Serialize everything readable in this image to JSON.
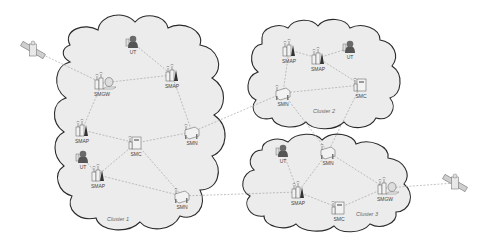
{
  "diagram": {
    "type": "network-topology",
    "clusters": [
      {
        "id": "c1",
        "label": "Cluster 1",
        "label_pos": [
          118,
          221
        ]
      },
      {
        "id": "c2",
        "label": "Cluster 2",
        "label_pos": [
          324,
          113
        ]
      },
      {
        "id": "c3",
        "label": "Cluster 3",
        "label_pos": [
          367,
          216
        ]
      }
    ],
    "nodes": [
      {
        "id": "sat1",
        "type": "satellite",
        "label": "",
        "x": 33,
        "y": 50,
        "cluster": "none"
      },
      {
        "id": "c1_ut1",
        "type": "UT",
        "label": "UT",
        "x": 133,
        "y": 43,
        "cluster": "c1"
      },
      {
        "id": "c1_smgw",
        "type": "SMGW",
        "label": "SMGW",
        "x": 102,
        "y": 83,
        "cluster": "c1"
      },
      {
        "id": "c1_smap1",
        "type": "SMAP",
        "label": "SMAP",
        "x": 172,
        "y": 75,
        "cluster": "c1"
      },
      {
        "id": "c1_smap2",
        "type": "SMAP",
        "label": "SMAP",
        "x": 82,
        "y": 130,
        "cluster": "c1"
      },
      {
        "id": "c1_smc",
        "type": "SMC",
        "label": "SMC",
        "x": 136,
        "y": 143,
        "cluster": "c1"
      },
      {
        "id": "c1_smn1",
        "type": "SMN",
        "label": "SMN",
        "x": 192,
        "y": 132,
        "cluster": "c1"
      },
      {
        "id": "c1_ut2",
        "type": "UT",
        "label": "UT",
        "x": 83,
        "y": 158,
        "cluster": "c1"
      },
      {
        "id": "c1_smap3",
        "type": "SMAP",
        "label": "SMAP",
        "x": 98,
        "y": 175,
        "cluster": "c1"
      },
      {
        "id": "c1_smn2",
        "type": "SMN",
        "label": "SMN",
        "x": 182,
        "y": 196,
        "cluster": "c1"
      },
      {
        "id": "c2_smap1",
        "type": "SMAP",
        "label": "SMAP",
        "x": 289,
        "y": 50,
        "cluster": "c2"
      },
      {
        "id": "c2_smap2",
        "type": "SMAP",
        "label": "SMAP",
        "x": 318,
        "y": 58,
        "cluster": "c2"
      },
      {
        "id": "c2_ut",
        "type": "UT",
        "label": "UT",
        "x": 350,
        "y": 48,
        "cluster": "c2"
      },
      {
        "id": "c2_smn",
        "type": "SMN",
        "label": "SMN",
        "x": 283,
        "y": 93,
        "cluster": "c2"
      },
      {
        "id": "c2_smc",
        "type": "SMC",
        "label": "SMC",
        "x": 361,
        "y": 85,
        "cluster": "c2"
      },
      {
        "id": "c3_ut",
        "type": "UT",
        "label": "UT",
        "x": 283,
        "y": 152,
        "cluster": "c3"
      },
      {
        "id": "c3_smn",
        "type": "SMN",
        "label": "SMN",
        "x": 328,
        "y": 152,
        "cluster": "c3"
      },
      {
        "id": "c3_smap",
        "type": "SMAP",
        "label": "SMAP",
        "x": 298,
        "y": 192,
        "cluster": "c3"
      },
      {
        "id": "c3_smc",
        "type": "SMC",
        "label": "SMC",
        "x": 339,
        "y": 208,
        "cluster": "c3"
      },
      {
        "id": "c3_smgw",
        "type": "SMGW",
        "label": "SMGW",
        "x": 385,
        "y": 188,
        "cluster": "c3"
      },
      {
        "id": "sat2",
        "type": "satellite",
        "label": "",
        "x": 455,
        "y": 183,
        "cluster": "none"
      }
    ],
    "links": [
      [
        "sat1",
        "c1_smgw"
      ],
      [
        "c1_ut1",
        "c1_smap1"
      ],
      [
        "c1_smgw",
        "c1_smap1"
      ],
      [
        "c1_smgw",
        "c1_smap2"
      ],
      [
        "c1_smap1",
        "c1_smn1"
      ],
      [
        "c1_smap2",
        "c1_smc"
      ],
      [
        "c1_smc",
        "c1_smn1"
      ],
      [
        "c1_smc",
        "c1_smap3"
      ],
      [
        "c1_smc",
        "c1_smn2"
      ],
      [
        "c1_ut2",
        "c1_smap3"
      ],
      [
        "c1_smap3",
        "c1_smn2"
      ],
      [
        "c1_smn1",
        "c2_smn"
      ],
      [
        "c1_smn2",
        "c3_smap"
      ],
      [
        "c2_smap1",
        "c2_smap2"
      ],
      [
        "c2_smap2",
        "c2_ut"
      ],
      [
        "c2_smap1",
        "c2_smn"
      ],
      [
        "c2_smap2",
        "c2_smc"
      ],
      [
        "c2_smn",
        "c2_smc"
      ],
      [
        "c2_smn",
        "c3_smn"
      ],
      [
        "c2_smc",
        "c3_smn"
      ],
      [
        "c3_ut",
        "c3_smap"
      ],
      [
        "c3_smn",
        "c3_smap"
      ],
      [
        "c3_smn",
        "c3_smgw"
      ],
      [
        "c3_smap",
        "c3_smc"
      ],
      [
        "c3_smc",
        "c3_smgw"
      ],
      [
        "c3_smgw",
        "sat2"
      ]
    ],
    "colors": {
      "cloud_fill": "#ececec",
      "cloud_stroke": "#2a2a2a",
      "link": "#9a9a9a",
      "ut_body": "#555555",
      "ut_head": "#6a6a6a",
      "device": "#f2f2f2",
      "device_stroke": "#555555"
    }
  }
}
